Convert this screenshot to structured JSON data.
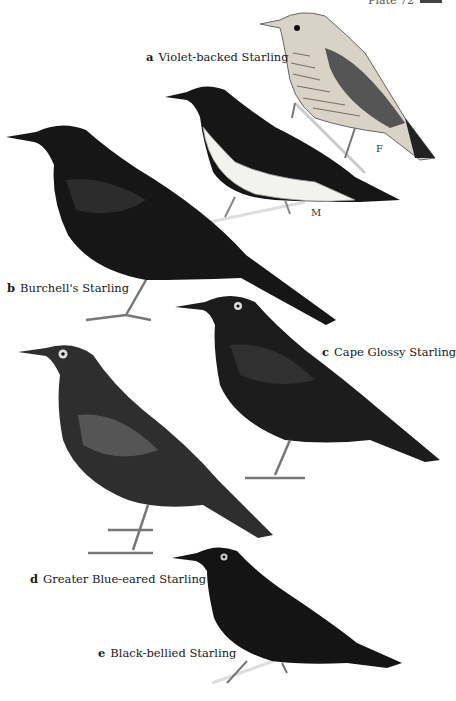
{
  "header": {
    "plate_text": "Plate 72"
  },
  "species": [
    {
      "letter": "a",
      "name": "Violet-backed Starling",
      "sexes": [
        "M",
        "F"
      ]
    },
    {
      "letter": "b",
      "name": "Burchell's Starling"
    },
    {
      "letter": "c",
      "name": "Cape Glossy Starling"
    },
    {
      "letter": "d",
      "name": "Greater Blue-eared Starling"
    },
    {
      "letter": "e",
      "name": "Black-bellied Starling"
    }
  ],
  "colors": {
    "background": "#ffffff",
    "bird_dark": "#151515",
    "bird_mid": "#3a3a3a",
    "female_body": "#d9d4c8",
    "male_belly": "#f2f2ee"
  }
}
